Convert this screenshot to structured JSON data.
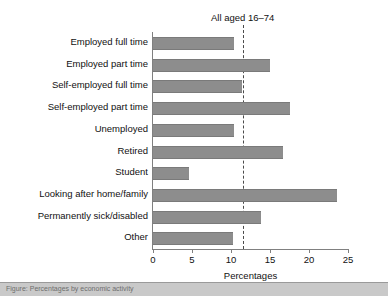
{
  "chart_data": {
    "type": "bar",
    "orientation": "horizontal",
    "title": "All aged 16–74",
    "xlabel": "Percentages",
    "ylabel": "",
    "xlim": [
      0,
      25
    ],
    "xticks": [
      0,
      5,
      10,
      15,
      20,
      25
    ],
    "xtick_labels": [
      "0",
      "5",
      "10",
      "15",
      "20",
      "25"
    ],
    "grid": false,
    "legend": "none",
    "bar_color": "#8d8d8d",
    "reference_line": {
      "label": "All aged 16–74",
      "value": 11.5,
      "style": "dashed",
      "color": "#4a4a4a"
    },
    "categories": [
      "Employed full time",
      "Employed part time",
      "Self-employed full time",
      "Self-employed part time",
      "Unemployed",
      "Retired",
      "Student",
      "Looking after home/family",
      "Permanently sick/disabled",
      "Other"
    ],
    "values": [
      10.4,
      15.0,
      11.4,
      17.5,
      10.4,
      16.7,
      4.6,
      23.6,
      13.8,
      10.2
    ]
  },
  "caption": {
    "text": "Figure: Percentages by economic activity"
  }
}
